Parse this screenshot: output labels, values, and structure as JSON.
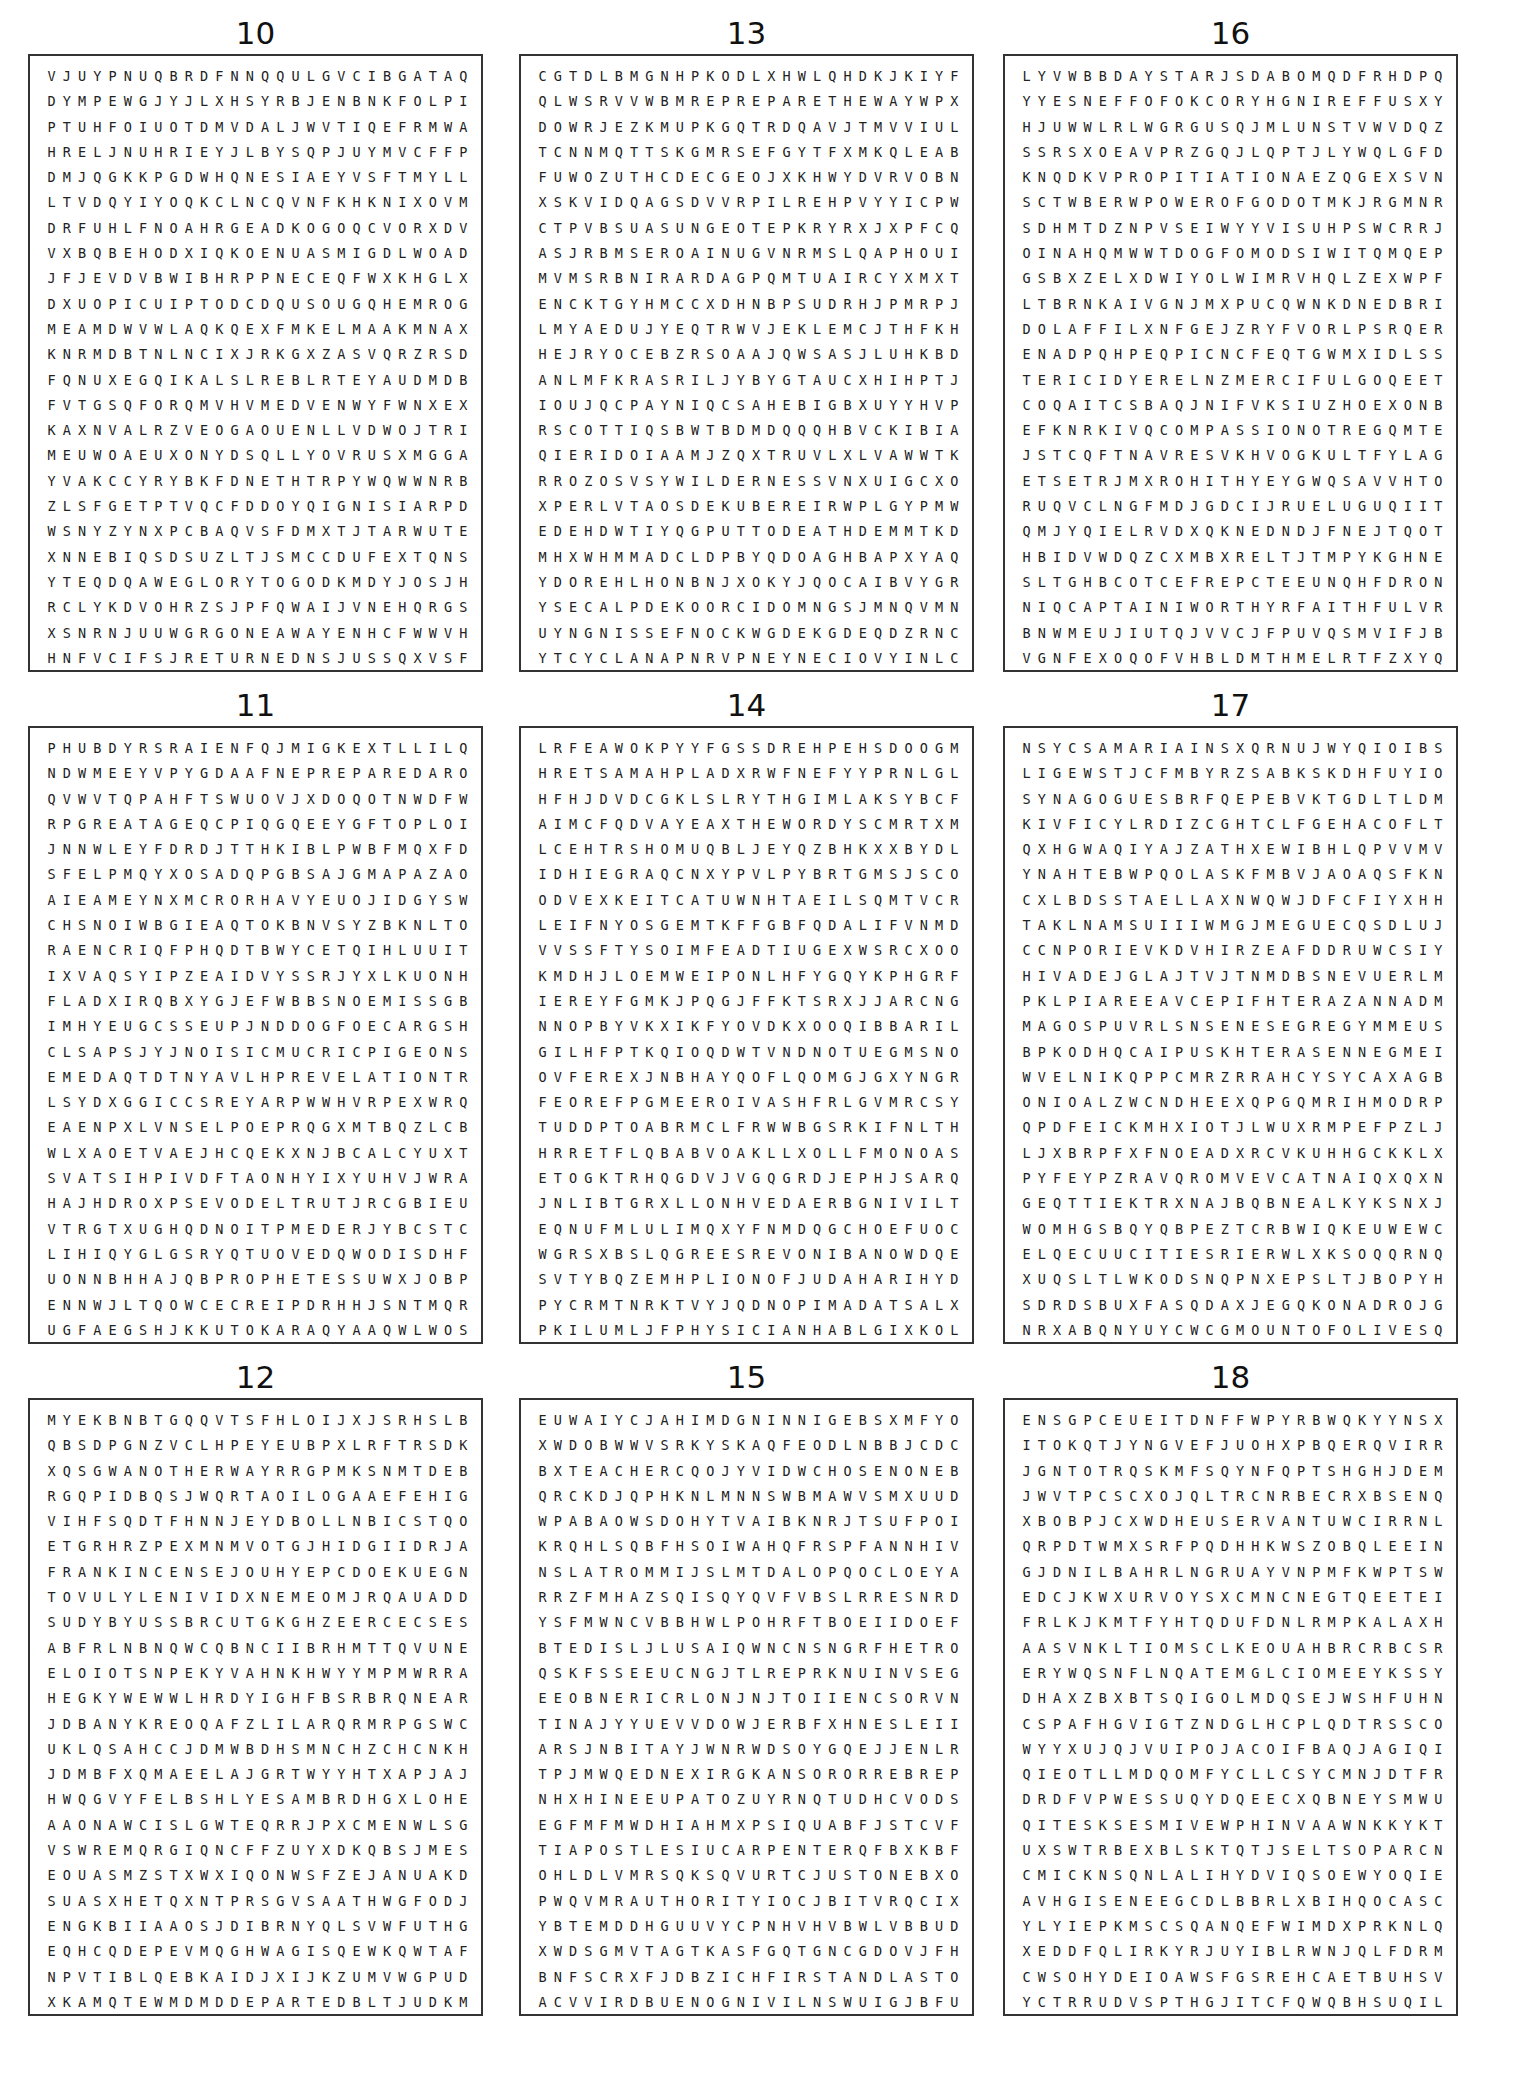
{
  "puzzles": [
    {
      "number": "10",
      "rows": [
        "VJUYPNUQBRDFNNQQULGVCIBGATAQ",
        "DYMPEWGJYJLXHSYRBJENBNKFOLPI",
        "PTUHFOIUOTDMVDALJWVTIQEFRMWA",
        "HRELJNUHRIEYJLBYSQPJUYMVCFFP",
        "DMJQGKKPGDWHQNESIAEYVSFTMYLL",
        "LTVDQYIYOQKCLNCQVNFKHKNIXOVM",
        "DRFUHLFNOAHRGEADKOGOQCVORXDV",
        "VXBQBEHODXIQKOENUASMIGDLWOAD",
        "JFJEVDVBWIBHRPPNECEQFWXKHGLX",
        "DXUOPICUIPTODCDQUSOUGQHEMROG",
        "MEAMDWVWLAQKQEXFMKELMAAKMNAX",
        "KNRMDBTNLNCIXJRKGXZASVQRZRSD",
        "FQNUXEGQIKALSLREBLRTEYAUDMDB",
        "FVTGSQFORQMVHVMEDVENWYFWNXEX",
        "KAXNVALRZVEOGAOUENLLVDWOJTRI",
        "MEUWOAEUXONYDSQLLYOVRUSXMGGA",
        "YVAKCCYRYBKFDNETHTRPYWQWWNRB",
        "ZLSFGETPTVQCFDDOYQIGNISIARPD",
        "WSNYZYNXPCBAQVSFDMXTJTARWUTE",
        "XNNEBIQSDSUZLTJSMCCDUFEXTQNS",
        "YTEQDQAWEGLORYTOGODKMDYJOSJH",
        "RCLYKDVOHRZSJPFQWAIJVNEHQRGS",
        "XSNRNJUUWGRGONEAWAYENHCFWWVH",
        "HNFVCIFSJRETURNEDNSJUSSQXVSF"
      ],
      "circled_words": [
        "GLORY TO GOD",
        "GONE AWAY",
        "RETURNED",
        "PRAISING (GNISIARP)"
      ]
    },
    {
      "number": "13",
      "rows": [
        "CGTDLBMGNHPKODLXHWLQHDKJKIYF",
        "QLWSRVVWBMREPREPARETHEWAYWPX",
        "DOWRJEZKMUPKGQTRDQAVJTMVVIUL",
        "TCNNMQTTSKGMRSEFGYTFXMKQLEAB",
        "FUWOZUTHCDECGEOJXKHWYDVRVOBN",
        "XSKVIDQAGSDVVRPILREHPVYYICPW",
        "CTPVBSUASUNGEOTEPKRYRXJXPFCQ",
        "ASJRBMSEROAINUGVNRMSLQAPHOUI",
        "MVMSRBNIRARDAGPQMTUAIRCYXMXT",
        "ENCKTGYHMCCXDHNBPSUDRHJPMRPJ",
        "LMYAEDUJYEQTRWVJEKLEMCJTHFKH",
        "HEJRYOCEBZRSOAAJQWSASJLUHKBD",
        "ANLMFKRASRILJYBYGTAUCXHIHPTJ",
        "IOUJQCPAYNIQCSAHEBIGBXUYYHVP",
        "RSCOTTIQSBWTBDMDQQQHBVCKIBIA",
        "QIERIDOIAAMJZQXTRUVLXLVAWWTK",
        "RROZOSVSYWILDERNESSVNXUIGCXO",
        "XPERLVTAOSDEKUBEREIRWPLGYPMW",
        "EDEHDWTIYQGPUTTODEATHDEMMTKD",
        "MHXWHMMADCLDPBYQDOAGHBAPXYAQ",
        "YDOREHLHONBNJXOKYJQOCAIBVYGR",
        "YSECALPDEKOORCIDOMNGSJMNQVMN",
        "UYNGNISSEFNOCKWGDEKGDEQDZRNC",
        "YTCYCLANAPNRVPNEYNECIOVYINLC"
      ],
      "circled_words": [
        "PREPARE THE WAY",
        "WILDERNESS",
        "REBUKED (DEKUBER)",
        "PUT TO DEATH",
        "HEROD (DOREH)",
        "CROOKED PLACES (SECALPDEKOORC)",
        "CONFESSING (GNISSEFNOC)",
        "VOICE (ECIOV)",
        "JUDEA (AEDUJ)"
      ]
    },
    {
      "number": "16",
      "rows": [
        "LYVWBBDAYSTARJSDABOMQDFRHDPQ",
        "YYESNEFFOFOKCORYHGNIREFFUSXY",
        "HJUWWLRLWGRGUSQJMLUNSTVWVDQZ",
        "SSRSXOEAVPRZGQJLQPTJLYWQLGFD",
        "KNQDKVPROPITIATIONAEZQGEXSVN",
        "SCTWBERWPOWEROFGODOTMKJRGMNR",
        "SDHMTDZNPVSEIWYYVISUHPSWCRRJ",
        "OINAHQMWWTDOGFOMODSIWITQMQEP",
        "GSBXZELXDWIYOLWIMRVHQLZEXWPF",
        "LTBRNKAIVGNJMXPUCQWNKDNEDBRI",
        "DOLAFFILXNFGEJZRYFVORLPSRQER",
        "ENADPQHPEQPICNCFEQTGWMXIDLSS",
        "TERICIDYERELNZMERCIFULGOQEET",
        "COQAITCSBAQJNIFVKSIUZHOEXONB",
        "EFKNRKIVQCOMPASSIONOTREGQMTE",
        "JSTCQFTNAVRESVKHVOGKULTFYLAG",
        "ETSETRJMXROHITHYEYGWQSAVVHTO",
        "RUQVCLNGFMDJGDCIJRUELUGUQIIT",
        "QMJYQIELRVDXQKNEDNDJFNEJTQOT",
        "HBIDVWDQZCXMBXRELTJTMPYKGHNE",
        "SLTGHBCOTCEFREPCTEEUNQHFDRON",
        "NIQCAPTAINIWORTHYRFAITHFULVR",
        "BNWMEUJIUTQJVVCJFPUVQSMVIFJB",
        "VGNFEXOQOFVHBLDMTHMELRTFZXYQ"
      ],
      "circled_words": [
        "DAYSTAR",
        "ROCK OF OFFENSE (ESNEFFOFOKCOR)",
        "SUFFERING (GNIREFFUS)",
        "PROPITIATION",
        "POWER OF GOD",
        "WISDOM OF GOD (DOGFOMODSIW)",
        "MERCIFUL",
        "COMPASSION",
        "SERVANT (TNAVRES)",
        "PERFECT (TCEFREP)",
        "CAPTAIN",
        "WORTHY",
        "FAITHFUL"
      ]
    },
    {
      "number": "11",
      "rows": [
        "PHUBDYRSRAIENFQJMIGKEXTLLILQ",
        "NDWMEEYVPYGDAAFNEPREPAREDARO",
        "QVWVTQPAHFTSWUOVJXDOQOTNWDFW",
        "RPGREATAGEQCPIQGQEEYGFTOPLOI",
        "JNNWLEYFDRDJTTHKIBLPWBFMQXFD",
        "SFELPMQYXOSADQPGBSAJGMAPAZAO",
        "AIEAMEYNXMCRORHAVYEUOJIDGYSW",
        "CHSNOIWBGIEAQTOKBNVSYZBKNLTO",
        "RAENCRIQFPHQDTBWYCETQIHLUUIT",
        "IXVAQSYIPZEAIDVYSSRJYXLKUONH",
        "FLADXIRQBXYGJEFWBBSNOEMISSGB",
        "IMHYEUGCSSEUPJNDDOGFOECARGSH",
        "CLSAPSJYJNOISICMUCRICPIGEONS",
        "EMEDAQTDTNYAVLHPREVELATIONTR",
        "LSYDXGGICCSREYARPWWHVRPEXWRQ",
        "EAENPXLVNSELPOEPRQGXMTBQZLCB",
        "WLXAOETVAEJHCQEKXNJBCALCYUXT",
        "SVATSIHPIVDFTAONHYIXYUHVJWRA",
        "HAJHDROXPSEVODELTRUTJRCGBIEU",
        "VTRGTXUGHQDNOITPMEDERJYBCSTC",
        "LIHIQYGLGSRYQTUOVEDQWODISDHF",
        "UONNBHHAJQBPROPHETESSUWXJOBP",
        "ENNWJLTQOWCECREIPDRHHJSNTMQR",
        "UGFAEGSHJKKUTOKARAQYAAQWLWOS"
      ],
      "circled_words": [
        "PREPARED",
        "GREAT AGE",
        "SIMEON (NOEMIS)",
        "GRACE OF GOD (DOGFOECARG)",
        "CIRCUMCISION (NOISICMUCRIC)",
        "PIGEONS",
        "REVELATION",
        "PRAYERS (SREYARP)",
        "PEOPLES (SELPOEP)",
        "TURTLEDOVES (SEVODELTRUT)",
        "REDEMPTION (NOITPMEDER)",
        "DEVOUT (TUOVED)",
        "PROPHETESS",
        "PIERCE (ECREIP)"
      ]
    },
    {
      "number": "14",
      "rows": [
        "LRFEAWOKPYYFGSSDREHPEHSDOOGM",
        "HRETSAMAHPLADXRWFNEFYYPRNLGL",
        "HFHJDVDCGKLSLRYTHGIMLAKSYBCF",
        "AIMCFQDVAYEAXTHEWORDYSCMRTXM",
        "LCEHTRSHOMUQBLJEYQZBHKXXBYDL",
        "IDHIEGRAQCNXYPVLPYBRTGMSJSCO",
        "ODVEXKEITCATUWNHTAEILSQMTVCR",
        "LEIFNYOSGEMTKFFGBFQDALIFVNMD",
        "VVSSFTYSOIMFEADTIUGEXWSRCXOO",
        "KMDHJLOEMWEIPONLHFYGQYKPHGRF",
        "IEREYFGMKJPQGJFFKTSRXJJARCNG",
        "NNOPBYVKXIKFYOVDKXOOQIBBARIL",
        "GILHFPTKQIOQDWTVNDNOTUEGMSNO",
        "OVFEREXJNBHAYQOFLQOMGJGXYNGR",
        "FEOREFPGMEEROIVASHFRLGVMRCSY",
        "TUDDPTOABRMCLFRWWBGSRKIFNLTH",
        "HRRETFLQBABVOAKLLXOLLFMONOAS",
        "ETOGKTRHQGDVJVGQGRDJEPHJSARQ",
        "JNLIBTGRXLLONHVEDAERBGNIVILT",
        "EQNUFMLULIMQXYFNMDQGCHOEFUOC",
        "WGRSXBSLQGREESREVONIBANOWDQE",
        "SVTYBQZEMHPLIONOFJUDAHARIHYD",
        "PYCRMTNRKTVYJQDNOPIMADATSALX",
        "PKILUMLJFPHYSICIANHABLGIXKOL"
      ],
      "circled_words": [
        "GOOD SHEPHERD (DREHPEHSDOOG)",
        "MASTER (RETSAM)",
        "ALPHA (AHPLA)",
        "ALMIGHTY (YTHGIMLA)",
        "THE WORD",
        "SAVIOR (ROIVAS)",
        "RABBI (IBBAR)",
        "LIVING BREAD (DAERBGNIVIL)",
        "OVERSEER (REESREVO)",
        "LION OF JUDAH",
        "LAST ADAM (MADATSAL)",
        "PHYSICIAN"
      ]
    },
    {
      "number": "17",
      "rows": [
        "NSYCSAMARIAINSXQRNUJWYQIOIBS",
        "LIGEWSTJCFMBYRZSABKSKDHFUYIO",
        "SYNAGOGUESBRFQEPEBVKTGDLTLDM",
        "KIVFICYLRDIZCGHTCLFGEHACOFLT",
        "QXHGWAQIYAJZATHXEWIBHLQPVVMV",
        "YNAHTEBWPQOLASKFMBVJAOAQSFKN",
        "CXLBDSSTAELLAXNWQWJDFCFIYXHH",
        "TAKLNAMSUIIIWMGJMEGUECQSDLUJ",
        "CCNPORIEVKDVHIRZEAFDDRUWCSIY",
        "HIVADEJGLAJTVJTNMDBSNEVUERLM",
        "PKLPIAREEAVCEPIFHTERAZANNADM",
        "MAGOSPUVRLSNSENESEGREGYMMEUS",
        "BPKODHQCAIPUSKHTERASENNEGMEI",
        "WVELNIKQPPCMRZRRAHCYSYCAXAGB",
        "ONIOALZWCNDHEEXQPGQMRIHMODRP",
        "QPDFEICKMHXIOTJLWUXRMPEFPZLJ",
        "LJXBRPFXFNOEADXRCVKUHHGCKKLX",
        "PYFEYPZRAVQROMVEVCATNAIQXQXN",
        "GEQTTIEKTRXNAJBQBNEALKYKSNXJ",
        "WOMHGSBQYQBPEZTCRBWIQKEUWEWC",
        "ELQECUUCITIESRIERWLXKSOQQRNQ",
        "XUQSLTLWKODSNQPNXEPSLTJBOPYH",
        "SDRDSBUXFASQDAXJEGQKONADROJG",
        "NRXABQNYUYCWCGMOUNTOFOLIVESQ"
      ],
      "circled_words": [
        "SAMARIA",
        "SYNAGOGUES",
        "BETHANY (YNAHTEB)",
        "NAZARETH (HTERAZAN)",
        "GERGESENES (SENESEGREG)",
        "GENNESARET (TERASENNEG)",
        "SYCHAR (RAHCYS)",
        "CITIES",
        "JORDAN (NADROJ)",
        "MOUNT OF OLIVES"
      ]
    },
    {
      "number": "12",
      "rows": [
        "MYEKBNBTGQQVTSFHLOIJXJSRHSLB",
        "QBSDPGNZVCLHPEYEUBPXLRFTRSDK",
        "XQSGWANOTHERWAYRRGPMKSNMTDEB",
        "RGQPIDBQSJWQRTAOILOGAAEFEHIG",
        "VIHFSQDTFHNNJEYDBOLLNBICSTQO",
        "ETGRHRZPEXMNMVOTGJHIDGIIDRJA",
        "FRANKINCENSEJOUHYEPCDOEKUEGN",
        "TOVULYLENIVIDXNEMEOMJRQAUADD",
        "SUDYBYUSSBRCUTGKGHZEERCECSES",
        "ABFRLNBNQWCQBNCIIBRHMTTQVUNE",
        "ELOIOTSNPEKYVAHNKHWYYMPMWRRA",
        "HEGKYWEWWLHRDYIGHFBSRBRQNEAR",
        "JDBANYKREOQAFZLILARQRMRPGSWC",
        "UKLQSAHCCJDMWBDHSMNCHZCHCNKH",
        "JDMBFXQMAEELAJGRTWYYHTXAPJAJ",
        "HWQGVYFELBSHLYESAMBRDHGXLOHE",
        "AAONAWCISLGWTEQRRJPXCMENWLSG",
        "VSWREMQRGIQNCFFZUYXDKQBSJMES",
        "EOUASMZSTXWXIQONWSFZEJANUAKD",
        "SUASXHETQXNTPRSGVSAATHWGFODJ",
        "ENGKBIIAAOSJDIBRNYQLSVWFUTHG",
        "EQHCQDEPEVMQGHWAGISQEWKQWTAF",
        "NPVTIBLQEBKAIDJXIJKZUMVWGPUD",
        "XKAMQTEWMDMDDEPARTEDBLTJUDKM"
      ],
      "circled_words": [
        "ANOTHER WAY",
        "FRANKINCENSE",
        "DIVINELY (YLENIVID)",
        "MEN",
        "DEPARTED"
      ]
    },
    {
      "number": "15",
      "rows": [
        "EUWAIYCJAHIMDGNINNIGEBSXMFYO",
        "XWDOBWWVSRKYSKAQFEODLNBBJCDC",
        "BXTEACHERCQOJYVIDWCHOSENONEB",
        "QRCKDJQPHKNLMNNSWBMAWVSMXUUD",
        "WPABAOWSDOHYTVAIBKNRJTSUFPOI",
        "KRQHLSQBFHSOIWAHQFRSPFANNHIV",
        "NSLATROMMIJSLMTDALOPQOCLOEYA",
        "RRZFMHAZSQISQYQVFVBSLRRESNRD",
        "YSFMWNCVBBHWLPOHRFTBOEIIDOEF",
        "BTEDISLJLUSAIQWNCNSNGRFHETRO",
        "QSKFSSEEUCNGJTLREPRKNUINVSEG",
        "EEOBNERICRLONJNJTOIIENCSORVN",
        "TINAJYYUEVVDOWJERBFXHNESLEII",
        "ARSJNBITAYJWNRWDSOYGQEJJENLR",
        "TPJMWQEDNEXIRGKANSORORREBREP",
        "NHXHINEEUPATOZUYRNQTUDHCVODS",
        "EGFMFMWDHIAHMXPSIQUABFJSTCVF",
        "TIAPOSTLESIUCARPENTERQFBXKBF",
        "OHLDLVMRSQKSQVURTCJUSTONEBXO",
        "PWQVMRAUTHORITYIOCJBITVRQCIX",
        "YBTEMDDHGUUVYCPNHVHVBWLVBBUD",
        "XWDSGMVTAGTKASFGQTGNCGDOVJFH",
        "BNFSCRXFJDBZICHFIRSTANDLASTO",
        "ACVVIRDBUENOGNIVILNSWUIGJBFU"
      ],
      "circled_words": [
        "BEGINNING (GNINNIGEB)",
        "TEACHER",
        "CHOSEN ONE",
        "IMMORTAL (LATROMMI)",
        "ONE (DNE)",
        "APOSTLE",
        "CARPENTER",
        "JUST ONE",
        "AUTHORITY",
        "FIRST AND LAST",
        "LIVING ONE (ENOGNIVIL)"
      ]
    },
    {
      "number": "18",
      "rows": [
        "ENSGPCEUEITDNFFWPYRBWQKYYNSX",
        "ITOKQTJYNGVEFJUOHXPBQERQVIRR",
        "JGNTOTRQSKMFSQYNFQPTSHGHJDEM",
        "JWVTPCSCXOJQLTRCNRBECRXBSENQ",
        "XBOBPJCXWDHEUSERVANTUWCIRRNL",
        "QRPDTWMXSRFPQDHHKWSZOBQLEEIN",
        "GJDNILBAHRLNGRUAYVNPMFKWPTSW",
        "EDCJKWXURVOYSXCMNCNEGTQEETEI",
        "FRLKJKMTFYHTQDUFDNLRMPKALAXH",
        "AASVNKLTIOMSCLKEOUAHBRCRBCSR",
        "ERYWQSNFLNQATEMGLCIOMEEYKSSY",
        "DHAXZBXBTSQIGOLMDQSEJWSHFUHN",
        "CSPAFHGVIGTZNDGLHCPLQDTRSSCO",
        "WYYXUJQJVUIPOJACOIFBAQJAGIQI",
        "QIEOTLLMDQOMFYCLLCSYCMNJDTFR",
        "DRDFVPWESSUQYDQEECXQBNEYSMWU",
        "QITESKSESMIVEWPHINVAAWNKKYKT",
        "UXSWTRBEXBLSKTQTJSELTSOPARCN",
        "CMICKNSQNLALIHYDVIQSOEWYOQIE",
        "AVHGISENEEGCDLBBRLXBIHQOCASC",
        "YLYIEPKMSCSQANQEFWIMDXPRKNLQ",
        "XEDDFQLIRKYRJUYIBLRWNJQLFDRM",
        "CWSOHYDEIOAWSFGSREHCAETBUHSV",
        "YCTRRUDVSPTHGJITCFQWQBHSUQIL"
      ],
      "circled_words": [
        "SERVANT",
        "BLIND (DNILB)",
        "APOSTLES (SELTSOPA)",
        "TEACHERS (SREHCAET)"
      ]
    }
  ]
}
